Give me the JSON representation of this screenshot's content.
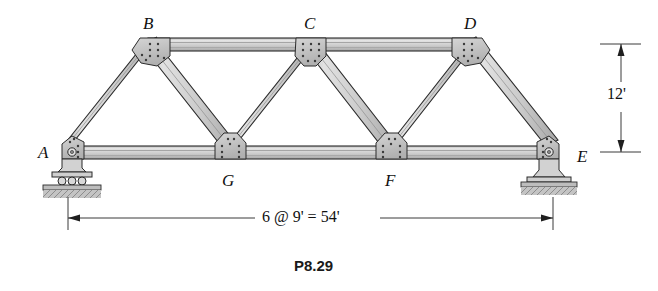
{
  "figure": {
    "caption": "P8.29",
    "type": "truss-structural-diagram"
  },
  "colors": {
    "member_fill": "#c9c9c9",
    "member_fill_light": "#dedede",
    "member_outline": "#2b2b2b",
    "gusset_fill": "#b8b8b8",
    "ground_fill": "#b0b0b0",
    "text": "#111111",
    "background": "#ffffff"
  },
  "nodes": [
    {
      "id": "A",
      "label": "A",
      "x": 68,
      "y": 152,
      "label_x": 38,
      "label_y": 144,
      "support": "pin"
    },
    {
      "id": "B",
      "label": "B",
      "x": 150,
      "y": 44,
      "label_x": 143,
      "label_y": 15,
      "support": "none"
    },
    {
      "id": "C",
      "label": "C",
      "x": 311,
      "y": 44,
      "label_x": 304,
      "label_y": 15,
      "support": "none"
    },
    {
      "id": "D",
      "label": "D",
      "x": 471,
      "y": 44,
      "label_x": 464,
      "label_y": 15,
      "support": "none"
    },
    {
      "id": "E",
      "label": "E",
      "x": 553,
      "y": 152,
      "label_x": 577,
      "label_y": 148,
      "support": "pin"
    },
    {
      "id": "F",
      "label": "F",
      "x": 391,
      "y": 152,
      "label_x": 385,
      "label_y": 172,
      "support": "none"
    },
    {
      "id": "G",
      "label": "G",
      "x": 230,
      "y": 152,
      "label_x": 222,
      "label_y": 172,
      "support": "none"
    }
  ],
  "members": [
    {
      "from": "A",
      "to": "B",
      "kind": "end-post"
    },
    {
      "from": "B",
      "to": "C",
      "kind": "top-chord"
    },
    {
      "from": "C",
      "to": "D",
      "kind": "top-chord"
    },
    {
      "from": "D",
      "to": "E",
      "kind": "end-post"
    },
    {
      "from": "A",
      "to": "G",
      "kind": "bottom-chord"
    },
    {
      "from": "G",
      "to": "F",
      "kind": "bottom-chord"
    },
    {
      "from": "F",
      "to": "E",
      "kind": "bottom-chord"
    },
    {
      "from": "B",
      "to": "G",
      "kind": "diagonal"
    },
    {
      "from": "G",
      "to": "C",
      "kind": "diagonal"
    },
    {
      "from": "C",
      "to": "F",
      "kind": "diagonal"
    },
    {
      "from": "F",
      "to": "D",
      "kind": "diagonal"
    }
  ],
  "dimensions": {
    "span": {
      "text": "6 @ 9' = 54'",
      "value": 54,
      "unit": "ft",
      "panels": 6,
      "panel_length": 9,
      "text_x": 268,
      "text_y": 212,
      "line_y": 218,
      "x_start": 68,
      "x_end": 553
    },
    "height": {
      "text": "12'",
      "value": 12,
      "unit": "ft",
      "text_x": 612,
      "text_y": 95,
      "line_x": 621,
      "y_top": 44,
      "y_bottom": 152
    }
  },
  "supports": {
    "left": {
      "node": "A",
      "type": "pin-on-base-plate"
    },
    "right": {
      "node": "E",
      "type": "pin-on-base-plate"
    }
  }
}
